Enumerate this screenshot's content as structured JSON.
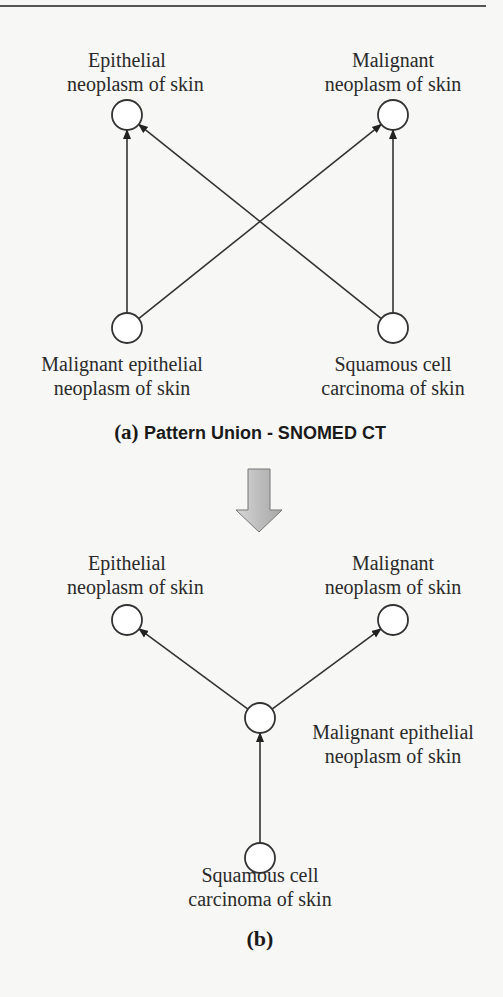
{
  "diagram_a": {
    "caption_prefix": "(a)",
    "caption": "Pattern Union - SNOMED CT",
    "nodes": {
      "epithelial": [
        "Epithelial",
        "neoplasm of skin"
      ],
      "malignant": [
        "Malignant",
        "neoplasm of skin"
      ],
      "malignant_epithelial": [
        "Malignant epithelial",
        "neoplasm of skin"
      ],
      "squamous": [
        "Squamous cell",
        "carcinoma of skin"
      ]
    },
    "edges": [
      [
        "malignant_epithelial",
        "epithelial"
      ],
      [
        "malignant_epithelial",
        "malignant"
      ],
      [
        "squamous",
        "epithelial"
      ],
      [
        "squamous",
        "malignant"
      ]
    ]
  },
  "transform_arrow": "down-arrow",
  "diagram_b": {
    "caption": "(b)",
    "nodes": {
      "epithelial": [
        "Epithelial",
        "neoplasm of skin"
      ],
      "malignant": [
        "Malignant",
        "neoplasm of skin"
      ],
      "malignant_epithelial": [
        "Malignant epithelial",
        "neoplasm of skin"
      ],
      "squamous": [
        "Squamous cell",
        "carcinoma of skin"
      ]
    },
    "edges": [
      [
        "malignant_epithelial",
        "epithelial"
      ],
      [
        "malignant_epithelial",
        "malignant"
      ],
      [
        "squamous",
        "malignant_epithelial"
      ]
    ]
  }
}
